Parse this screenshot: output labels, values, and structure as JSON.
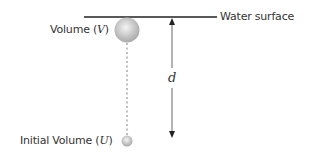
{
  "diagram": {
    "water_surface_label": "Water surface",
    "volume_label_prefix": "Volume (",
    "volume_var": "V",
    "volume_label_suffix": ")",
    "initial_label_prefix": "Initial Volume (",
    "initial_var": "U",
    "initial_label_suffix": ")",
    "depth_var": "d",
    "colors": {
      "line": "#222222",
      "arrow": "#555555",
      "sphere_light": "#f4f4f4",
      "sphere_dark": "#a8a8a8",
      "dotted": "#aaaaaa"
    }
  }
}
